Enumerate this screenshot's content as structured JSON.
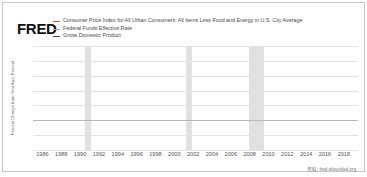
{
  "brand": "FRED",
  "source": "资料: fred.stlouisfed.org",
  "colors": {
    "cpi": "#c8553d",
    "fedfunds": "#8fa9b8",
    "gdp": "#3d4f63",
    "recession_band": "#cfcfcf",
    "gridline": "#e2e2e2"
  },
  "legend": [
    {
      "label": "Consumer Price Index for All Urban Consumers: All Items Less Food and Energy in U.S. City Average",
      "color": "#c8553d"
    },
    {
      "label": "Federal Funds Effective Rate",
      "color": "#8fa9b8"
    },
    {
      "label": "Gross Domestic Product",
      "color": "#3d4f63"
    }
  ],
  "chart_data": {
    "type": "line",
    "title": "",
    "xlabel": "",
    "ylabel": "Percent Change from Year Ago, Percent",
    "xlim": [
      1985,
      2019.5
    ],
    "ylim": [
      -5.0,
      12.5
    ],
    "grid": true,
    "legend_position": "top",
    "yticks": [
      "12.5",
      "10.0",
      "7.5",
      "5.0",
      "2.5",
      "0.0",
      "-2.5",
      "-5.0"
    ],
    "ytick_values": [
      12.5,
      10.0,
      7.5,
      5.0,
      2.5,
      0.0,
      -2.5,
      -5.0
    ],
    "xticks": [
      "1986",
      "1988",
      "1990",
      "1992",
      "1994",
      "1996",
      "1998",
      "2000",
      "2002",
      "2004",
      "2006",
      "2008",
      "2010",
      "2012",
      "2014",
      "2016",
      "2018"
    ],
    "xtick_values": [
      1986,
      1988,
      1990,
      1992,
      1994,
      1996,
      1998,
      2000,
      2002,
      2004,
      2006,
      2008,
      2010,
      2012,
      2014,
      2016,
      2018
    ],
    "recession_bands": [
      {
        "start": 1990.5,
        "end": 1991.2
      },
      {
        "start": 2001.2,
        "end": 2001.9
      },
      {
        "start": 2007.9,
        "end": 2009.5
      }
    ],
    "series": [
      {
        "name": "Consumer Price Index for All Urban Consumers: All Items Less Food and Energy in U.S. City Average",
        "color": "#c8553d",
        "x": [
          1985.0,
          1985.5,
          1986.0,
          1986.5,
          1987.0,
          1987.5,
          1988.0,
          1988.5,
          1989.0,
          1989.5,
          1990.0,
          1990.5,
          1991.0,
          1991.5,
          1992.0,
          1992.5,
          1993.0,
          1993.5,
          1994.0,
          1994.5,
          1995.0,
          1995.5,
          1996.0,
          1996.5,
          1997.0,
          1997.5,
          1998.0,
          1998.5,
          1999.0,
          1999.5,
          2000.0,
          2000.5,
          2001.0,
          2001.5,
          2002.0,
          2002.5,
          2003.0,
          2003.5,
          2004.0,
          2004.5,
          2005.0,
          2005.5,
          2006.0,
          2006.5,
          2007.0,
          2007.5,
          2008.0,
          2008.5,
          2009.0,
          2009.5,
          2010.0,
          2010.5,
          2011.0,
          2011.5,
          2012.0,
          2012.5,
          2013.0,
          2013.5,
          2014.0,
          2014.5,
          2015.0,
          2015.5,
          2016.0,
          2016.5,
          2017.0,
          2017.5,
          2018.0,
          2018.5,
          2019.0,
          2019.4
        ],
        "y": [
          9.0,
          8.2,
          7.4,
          6.5,
          6.1,
          5.9,
          5.5,
          5.3,
          5.0,
          4.7,
          4.6,
          5.0,
          5.3,
          4.8,
          4.3,
          3.8,
          3.5,
          3.2,
          3.0,
          2.9,
          3.0,
          3.0,
          2.8,
          2.7,
          2.5,
          2.3,
          2.3,
          2.4,
          2.2,
          2.0,
          2.4,
          2.5,
          2.7,
          2.7,
          2.4,
          2.2,
          1.7,
          1.4,
          1.2,
          1.8,
          2.2,
          2.1,
          2.1,
          2.6,
          2.6,
          2.3,
          2.4,
          2.4,
          1.8,
          1.5,
          1.0,
          0.9,
          1.2,
          2.0,
          2.2,
          2.0,
          1.8,
          1.7,
          1.7,
          1.8,
          1.8,
          2.0,
          2.2,
          2.2,
          2.0,
          1.8,
          2.1,
          2.2,
          2.1,
          2.1
        ]
      },
      {
        "name": "Federal Funds Effective Rate",
        "color": "#8fa9b8",
        "x": [
          1985.0,
          1985.5,
          1986.0,
          1986.5,
          1987.0,
          1987.5,
          1988.0,
          1988.5,
          1989.0,
          1989.5,
          1990.0,
          1990.5,
          1991.0,
          1991.5,
          1992.0,
          1992.5,
          1993.0,
          1993.5,
          1994.0,
          1994.5,
          1995.0,
          1995.5,
          1996.0,
          1996.5,
          1997.0,
          1997.5,
          1998.0,
          1998.5,
          1999.0,
          1999.5,
          2000.0,
          2000.5,
          2001.0,
          2001.5,
          2002.0,
          2002.5,
          2003.0,
          2003.5,
          2004.0,
          2004.5,
          2005.0,
          2005.5,
          2006.0,
          2006.5,
          2007.0,
          2007.5,
          2008.0,
          2008.5,
          2009.0,
          2009.5,
          2010.0,
          2010.5,
          2011.0,
          2011.5,
          2012.0,
          2012.5,
          2013.0,
          2013.5,
          2014.0,
          2014.5,
          2015.0,
          2015.5,
          2016.0,
          2016.5,
          2017.0,
          2017.5,
          2018.0,
          2018.5,
          2019.0,
          2019.4
        ],
        "y": [
          8.3,
          7.9,
          7.5,
          6.3,
          6.1,
          6.8,
          6.6,
          7.7,
          9.3,
          9.0,
          8.2,
          8.0,
          6.1,
          5.4,
          4.0,
          3.2,
          3.0,
          3.0,
          3.3,
          4.7,
          5.9,
          5.8,
          5.3,
          5.3,
          5.3,
          5.5,
          5.5,
          5.1,
          4.7,
          5.2,
          5.9,
          6.5,
          5.3,
          3.5,
          1.7,
          1.7,
          1.2,
          1.0,
          1.0,
          1.4,
          2.6,
          3.5,
          4.5,
          5.2,
          5.3,
          5.0,
          3.2,
          2.0,
          0.2,
          0.2,
          0.2,
          0.2,
          0.1,
          0.1,
          0.1,
          0.2,
          0.1,
          0.1,
          0.1,
          0.1,
          0.1,
          0.2,
          0.4,
          0.4,
          0.9,
          1.2,
          1.6,
          2.1,
          2.4,
          2.4
        ]
      },
      {
        "name": "Gross Domestic Product",
        "color": "#3d4f63",
        "x": [
          1985.0,
          1985.5,
          1986.0,
          1986.5,
          1987.0,
          1987.5,
          1988.0,
          1988.5,
          1989.0,
          1989.5,
          1990.0,
          1990.5,
          1991.0,
          1991.5,
          1992.0,
          1992.5,
          1993.0,
          1993.5,
          1994.0,
          1994.5,
          1995.0,
          1995.5,
          1996.0,
          1996.5,
          1997.0,
          1997.5,
          1998.0,
          1998.5,
          1999.0,
          1999.5,
          2000.0,
          2000.5,
          2001.0,
          2001.5,
          2002.0,
          2002.5,
          2003.0,
          2003.5,
          2004.0,
          2004.5,
          2005.0,
          2005.5,
          2006.0,
          2006.5,
          2007.0,
          2007.5,
          2008.0,
          2008.5,
          2009.0,
          2009.5,
          2010.0,
          2010.5,
          2011.0,
          2011.5,
          2012.0,
          2012.5,
          2013.0,
          2013.5,
          2014.0,
          2014.5,
          2015.0,
          2015.5,
          2016.0,
          2016.5,
          2017.0,
          2017.5,
          2018.0,
          2018.5,
          2019.0,
          2019.4
        ],
        "y": [
          7.5,
          6.4,
          5.6,
          5.3,
          6.0,
          6.8,
          7.6,
          7.8,
          7.3,
          6.6,
          5.8,
          4.6,
          3.0,
          3.3,
          4.9,
          5.4,
          5.2,
          5.0,
          6.0,
          6.3,
          4.8,
          4.4,
          5.7,
          6.0,
          6.2,
          6.1,
          5.6,
          5.4,
          6.2,
          6.5,
          6.4,
          5.5,
          3.3,
          2.8,
          3.4,
          3.8,
          4.7,
          5.5,
          6.6,
          6.3,
          6.5,
          6.4,
          6.0,
          5.3,
          4.6,
          4.5,
          3.2,
          1.2,
          -2.2,
          -3.9,
          -1.0,
          3.0,
          4.0,
          3.8,
          4.2,
          4.0,
          3.2,
          3.6,
          4.3,
          4.4,
          3.9,
          3.5,
          2.7,
          2.8,
          4.2,
          4.5,
          5.4,
          5.3,
          4.1,
          4.0
        ]
      }
    ]
  }
}
